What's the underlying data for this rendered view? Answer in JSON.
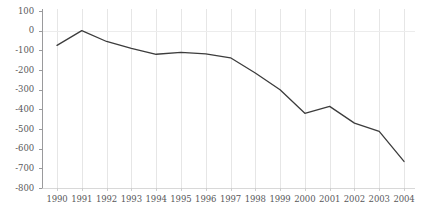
{
  "chart_data": {
    "type": "line",
    "title": "",
    "subtitle": "",
    "xlabel": "",
    "ylabel": "",
    "categories": [
      "1990",
      "1991",
      "1992",
      "1993",
      "1994",
      "1995",
      "1996",
      "1997",
      "1998",
      "1999",
      "2000",
      "2001",
      "2002",
      "2003",
      "2004"
    ],
    "values": [
      -75,
      0,
      -55,
      -90,
      -120,
      -110,
      -118,
      -138,
      -215,
      -300,
      -420,
      -385,
      -470,
      -512,
      -665
    ],
    "series": [
      {
        "name": "",
        "values": [
          -75,
          0,
          -55,
          -90,
          -120,
          -110,
          -118,
          -138,
          -215,
          -300,
          -420,
          -385,
          -470,
          -512,
          -665
        ]
      }
    ],
    "ylim": [
      -800,
      100
    ],
    "yticks": [
      100,
      0,
      -100,
      -200,
      -300,
      -400,
      -500,
      -600,
      -700,
      -800
    ],
    "ytick_labels": [
      "100",
      "0",
      "-100",
      "-200",
      "-300",
      "-400",
      "-500",
      "-600",
      "-700",
      "-800"
    ],
    "xtick_labels": [
      "1990",
      "1991",
      "1992",
      "1993",
      "1994",
      "1995",
      "1996",
      "1997",
      "1998",
      "1999",
      "2000",
      "2001",
      "2002",
      "2003",
      "2004"
    ],
    "grid": "vertical-and-zero-line",
    "legend": "none",
    "legend_position": "none",
    "annotations": []
  },
  "style": {
    "line_color": "#3c3c3c",
    "grid_color": "#e6e6e6",
    "axis_color": "#9a9a9c",
    "tick_color": "#9a9a9c",
    "text_color": "#59595b",
    "background": "#ffffff"
  }
}
